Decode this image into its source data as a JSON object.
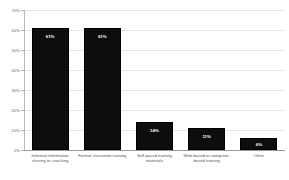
{
  "chart_data": {
    "type": "bar",
    "title": "",
    "subtitle": "",
    "xlabel": "",
    "ylabel": "Percent of respondents",
    "ylim": [
      0,
      70
    ],
    "grid": true,
    "legend": false,
    "orientation": "vertical",
    "bar_color": "#0d0d0d",
    "background_color": "#ffffff",
    "gridline_color": "#e6e6e6",
    "categories": [
      "Informal information sharing or coaching",
      "Formal classroom training",
      "Self-paced training materials",
      "Web-based or computer-based training",
      "Other"
    ],
    "values": [
      61,
      61,
      14,
      11,
      6
    ],
    "value_labels": [
      "61%",
      "61%",
      "14%",
      "11%",
      "6%"
    ],
    "ytick_values": [
      0,
      10,
      20,
      30,
      40,
      50,
      60,
      70
    ],
    "ytick_labels": [
      "0%",
      "10%",
      "20%",
      "30%",
      "40%",
      "50%",
      "60%",
      "70%"
    ]
  }
}
